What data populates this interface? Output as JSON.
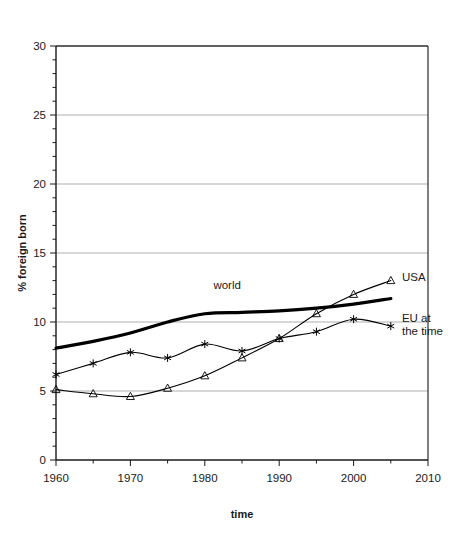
{
  "chart_data": {
    "type": "line",
    "title": "",
    "xlabel": "time",
    "ylabel": "% foreign born",
    "xlim": [
      1960,
      2010
    ],
    "ylim": [
      0,
      30
    ],
    "x": [
      1960,
      1965,
      1970,
      1975,
      1980,
      1985,
      1990,
      1995,
      2000,
      2005
    ],
    "xticks": [
      1960,
      1970,
      1980,
      1990,
      2000,
      2010
    ],
    "xticklabels": [
      "1960",
      "1970",
      "1980",
      "1990",
      "2000",
      "2010"
    ],
    "xminor_step": 5,
    "yticks": [
      0,
      5,
      10,
      15,
      20,
      25,
      30
    ],
    "yticklabels": [
      "0",
      "5",
      "10",
      "15",
      "20",
      "25",
      "30"
    ],
    "yminor_step": 1,
    "grid": "horizontal-major",
    "legend": "inline-annotations",
    "series": [
      {
        "name": "world",
        "label": "world",
        "marker": "none",
        "linewidth": 3.2,
        "color": "#000000",
        "values": [
          8.1,
          8.6,
          9.2,
          10.0,
          10.6,
          10.7,
          10.8,
          11.0,
          11.3,
          11.7
        ],
        "label_x": 1983,
        "label_y": 12.4
      },
      {
        "name": "eu-at-the-time",
        "label": "EU at the time",
        "marker": "asterisk",
        "linewidth": 1.1,
        "color": "#000000",
        "values": [
          6.2,
          7.0,
          7.8,
          7.4,
          8.4,
          7.9,
          8.8,
          9.3,
          10.2,
          9.7
        ],
        "label_x": 2006.5,
        "label_y": 10.0
      },
      {
        "name": "usa",
        "label": "USA",
        "marker": "triangle",
        "linewidth": 1.1,
        "color": "#000000",
        "values": [
          5.1,
          4.8,
          4.6,
          5.2,
          6.1,
          7.4,
          8.8,
          10.6,
          12.0,
          13.0
        ],
        "label_x": 2006.5,
        "label_y": 13.0
      }
    ]
  },
  "axis": {
    "x_title": "time",
    "y_title": "% foreign born"
  }
}
